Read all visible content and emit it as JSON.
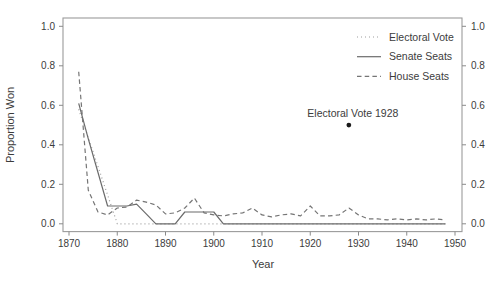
{
  "figure": {
    "background": "#ffffff",
    "box_color": "#9b9b9b",
    "tick_color": "#8a8a8a",
    "text_color": "#3c3c3c"
  },
  "legend": {
    "position": "top-right",
    "items": [
      {
        "label": "Electoral Vote",
        "style": "dotted",
        "color": "#9e9e9e"
      },
      {
        "label": "Senate Seats",
        "style": "solid",
        "color": "#6b6b6b"
      },
      {
        "label": "House Seats",
        "style": "dashed",
        "color": "#757575"
      }
    ]
  },
  "chart_data": {
    "type": "line",
    "title": "",
    "xlabel": "Year",
    "ylabel": "Proportion Won",
    "xlim": [
      1869,
      1952
    ],
    "ylim": [
      -0.04,
      1.04
    ],
    "x_ticks": [
      1870,
      1880,
      1890,
      1900,
      1910,
      1920,
      1930,
      1940,
      1950
    ],
    "y_ticks": [
      0.0,
      0.2,
      0.4,
      0.6,
      0.8,
      1.0
    ],
    "grid": false,
    "legend_position": "top-right",
    "mirrored_right_axis": true,
    "series": [
      {
        "name": "Electoral Vote",
        "style": "dotted",
        "color": "#9e9e9e",
        "x": [
          1872,
          1876,
          1880,
          1884,
          1888,
          1892,
          1896,
          1900,
          1904,
          1908,
          1912,
          1916,
          1920,
          1924,
          1928,
          1932,
          1936,
          1940,
          1944,
          1948
        ],
        "y": [
          0.58,
          0.29,
          0.0,
          0.0,
          0.0,
          0.0,
          0.0,
          0.0,
          0.0,
          0.0,
          0.0,
          0.0,
          0.0,
          0.0,
          0.0,
          0.0,
          0.0,
          0.0,
          0.0,
          0.0
        ]
      },
      {
        "name": "Senate Seats",
        "style": "solid",
        "color": "#6b6b6b",
        "x": [
          1872,
          1874,
          1876,
          1878,
          1880,
          1882,
          1884,
          1886,
          1888,
          1890,
          1892,
          1894,
          1896,
          1898,
          1900,
          1902,
          1904,
          1906,
          1908,
          1910,
          1912,
          1914,
          1916,
          1918,
          1920,
          1922,
          1924,
          1926,
          1928,
          1930,
          1932,
          1934,
          1936,
          1938,
          1940,
          1942,
          1944,
          1946,
          1948
        ],
        "y": [
          0.61,
          0.43,
          0.26,
          0.09,
          0.09,
          0.09,
          0.1,
          0.05,
          0.0,
          0.0,
          0.0,
          0.06,
          0.06,
          0.06,
          0.06,
          0.0,
          0.0,
          0.0,
          0.0,
          0.0,
          0.0,
          0.0,
          0.0,
          0.0,
          0.0,
          0.0,
          0.0,
          0.0,
          0.0,
          0.0,
          0.0,
          0.0,
          0.0,
          0.0,
          0.0,
          0.0,
          0.0,
          0.0,
          0.0
        ]
      },
      {
        "name": "House Seats",
        "style": "dashed",
        "color": "#757575",
        "x": [
          1872,
          1874,
          1876,
          1878,
          1880,
          1882,
          1884,
          1886,
          1888,
          1890,
          1892,
          1894,
          1896,
          1898,
          1900,
          1902,
          1904,
          1906,
          1908,
          1910,
          1912,
          1914,
          1916,
          1918,
          1920,
          1922,
          1924,
          1926,
          1928,
          1930,
          1932,
          1934,
          1936,
          1938,
          1940,
          1942,
          1944,
          1946,
          1948
        ],
        "y": [
          0.77,
          0.17,
          0.06,
          0.045,
          0.08,
          0.085,
          0.12,
          0.11,
          0.095,
          0.05,
          0.055,
          0.08,
          0.13,
          0.055,
          0.045,
          0.04,
          0.05,
          0.055,
          0.08,
          0.045,
          0.035,
          0.045,
          0.05,
          0.04,
          0.09,
          0.04,
          0.04,
          0.045,
          0.08,
          0.045,
          0.025,
          0.025,
          0.02,
          0.025,
          0.02,
          0.025,
          0.02,
          0.025,
          0.02
        ]
      }
    ],
    "annotations": [
      {
        "label": "Electoral Vote 1928",
        "x": 1928,
        "y": 0.5,
        "marker": "point",
        "marker_color": "#1a1a1a"
      }
    ]
  }
}
